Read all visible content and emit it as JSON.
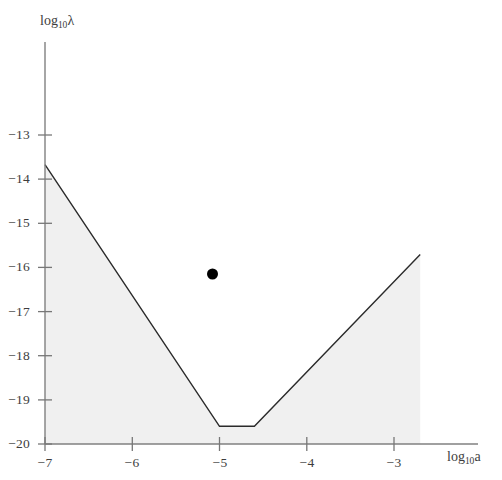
{
  "figure": {
    "background_color": "#ffffff",
    "axis_color": "#808080",
    "curve_color": "#2b2b2b",
    "fill_color": "#f0f0f0",
    "point_color": "#000000",
    "tick_color": "#777777"
  },
  "axes": {
    "x_title_prefix": "log",
    "x_title_sub": "10",
    "x_title_var": "a",
    "y_title_prefix": "log",
    "y_title_sub": "10",
    "y_title_var": "λ"
  },
  "chart_data": {
    "type": "line",
    "title": "",
    "subtitle": "",
    "xlabel": "log10 a",
    "ylabel": "log10 lambda",
    "xlim": [
      -7.3,
      -2.1
    ],
    "ylim": [
      -20.0,
      -12.35
    ],
    "grid": false,
    "legend": null,
    "x_ticks": [
      -7,
      -6,
      -5,
      -4,
      -3
    ],
    "x_tick_labels": [
      "−7",
      "−6",
      "−5",
      "−4",
      "−3"
    ],
    "y_ticks": [
      -20,
      -19,
      -18,
      -17,
      -16,
      -15,
      -14,
      -13
    ],
    "y_tick_labels": [
      "−20",
      "−19",
      "−18",
      "−17",
      "−16",
      "−15",
      "−14",
      "−13"
    ],
    "series": [
      {
        "name": "exclusion boundary",
        "type": "line",
        "x": [
          -7.0,
          -5.0,
          -4.6,
          -2.7
        ],
        "y": [
          -13.67,
          -19.6,
          -19.6,
          -15.71
        ]
      },
      {
        "name": "excluded region (shaded)",
        "type": "area",
        "fill_to": -20.0,
        "x": [
          -7.0,
          -5.0,
          -4.6,
          -2.7
        ],
        "y": [
          -13.67,
          -19.6,
          -19.6,
          -15.71
        ]
      },
      {
        "name": "data point",
        "type": "scatter",
        "x": [
          -5.08
        ],
        "y": [
          -16.15
        ],
        "marker": "filled-circle",
        "marker_size_px": 11
      }
    ]
  }
}
